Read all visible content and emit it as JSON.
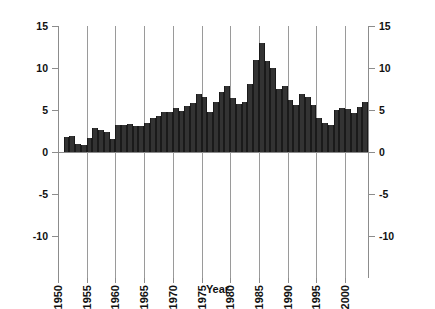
{
  "chart_data": {
    "type": "bar",
    "title": "",
    "xlabel": "Year",
    "ylabel": "Percent",
    "ylim": [
      -10,
      15
    ],
    "yticks": [
      -10,
      -5,
      0,
      5,
      10,
      15
    ],
    "ytick_labels_left": [
      "15",
      "10",
      "5",
      "0",
      "-5",
      "-10"
    ],
    "ytick_labels_right": [
      "15",
      "10",
      "5",
      "0",
      "-5",
      "-10"
    ],
    "xlim": [
      1950,
      2004
    ],
    "xticks": [
      1950,
      1955,
      1960,
      1965,
      1970,
      1975,
      1980,
      1985,
      1990,
      1995,
      2000
    ],
    "xtick_labels": [
      "1950",
      "1955",
      "1960",
      "1965",
      "1970",
      "1975",
      "1980",
      "1985",
      "1990",
      "1995",
      "2000"
    ],
    "grid": "vertical-only",
    "legend": "none",
    "bar_color": "#333333",
    "axis_color": "#8c8c8c",
    "gridline_color": "#9a9a9a",
    "categories": [
      1951,
      1952,
      1953,
      1954,
      1955,
      1956,
      1957,
      1958,
      1959,
      1960,
      1961,
      1962,
      1963,
      1964,
      1965,
      1966,
      1967,
      1968,
      1969,
      1970,
      1971,
      1972,
      1973,
      1974,
      1975,
      1976,
      1977,
      1978,
      1979,
      1980,
      1981,
      1982,
      1983,
      1984,
      1985,
      1986,
      1987,
      1988,
      1989,
      1990,
      1991,
      1992,
      1993,
      1994,
      1995,
      1996,
      1997,
      1998,
      1999,
      2000,
      2001,
      2002,
      2003
    ],
    "values": [
      1.8,
      1.9,
      1.0,
      0.8,
      1.7,
      2.8,
      2.6,
      2.4,
      1.5,
      3.2,
      3.2,
      3.3,
      3.1,
      3.1,
      3.4,
      4.0,
      4.3,
      4.8,
      4.8,
      5.2,
      4.9,
      5.5,
      5.8,
      6.9,
      6.5,
      4.8,
      5.9,
      7.2,
      7.9,
      6.4,
      5.7,
      5.9,
      8.1,
      10.9,
      13.0,
      10.8,
      10.0,
      7.5,
      7.8,
      6.2,
      5.6,
      6.9,
      6.6,
      5.6,
      4.0,
      3.5,
      3.2,
      5.0,
      5.2,
      5.1,
      4.6,
      5.3,
      6.0
    ],
    "peak": {
      "year": 1985,
      "value": 13.0
    },
    "series_name": "Percent"
  }
}
